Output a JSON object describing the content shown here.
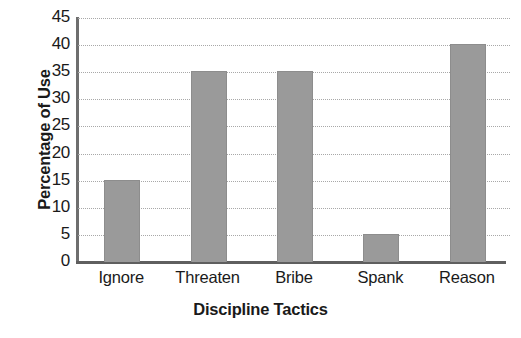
{
  "chart_data": {
    "type": "bar",
    "title": "",
    "xlabel": "Discipline Tactics",
    "ylabel": "Percentage of Use",
    "categories": [
      "Ignore",
      "Threaten",
      "Bribe",
      "Spank",
      "Reason"
    ],
    "values": [
      15,
      35,
      35,
      5,
      40
    ],
    "ylim": [
      0,
      45
    ],
    "y_ticks": [
      0,
      5,
      10,
      15,
      20,
      25,
      30,
      35,
      40,
      45
    ],
    "y_tick_labels": [
      "0",
      "5",
      "10",
      "15",
      "20",
      "25",
      "30",
      "35",
      "40",
      "45"
    ],
    "grid": true,
    "grid_style": "dotted",
    "grid_axis": "y",
    "legend": false,
    "legend_position": "none",
    "bar_color": "#9a9a9a",
    "axis_color": "#5f5f5f",
    "grid_color": "#a8a8a8",
    "text_color": "#1a1a1a",
    "background_color": "#ffffff"
  }
}
